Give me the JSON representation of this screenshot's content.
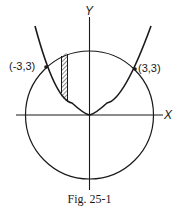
{
  "figure": {
    "caption": "Fig. 25-1",
    "axes": {
      "x_label": "X",
      "y_label": "Y"
    },
    "points": [
      {
        "label": "(-3,3)",
        "x": -3,
        "y": 3
      },
      {
        "label": "(3,3)",
        "x": 3,
        "y": 3
      }
    ],
    "curves": [
      {
        "name": "parabola",
        "description": "upward parabola with vertex at origin passing through (-3,3) and (3,3)"
      },
      {
        "name": "circle",
        "description": "circle intersecting parabola at (-3,3) and (3,3)"
      }
    ],
    "shaded_region": {
      "description": "thin vertical hatched strip between parabola (bottom) and circle (top), left of Y axis"
    },
    "colors": {
      "ink": "#1a1a1a",
      "background": "#ffffff"
    }
  }
}
